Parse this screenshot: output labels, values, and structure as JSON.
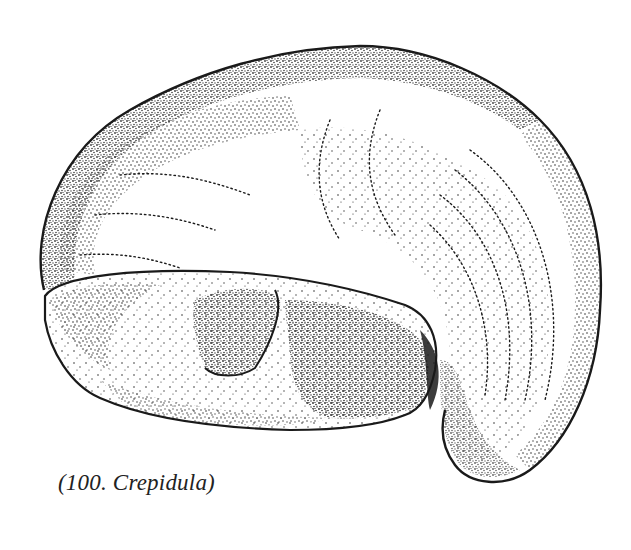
{
  "image": {
    "subject": "Crepidula shell (slipper snail) stipple illustration",
    "style": "black-and-white pen stippling",
    "colors": {
      "ink": "#1a1a1a",
      "paper": "#ffffff"
    }
  },
  "caption": {
    "text": "(100. Crepidula)"
  }
}
